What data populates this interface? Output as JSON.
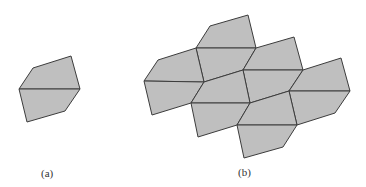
{
  "figure": {
    "panels": [
      {
        "id": "a",
        "label": "(a)",
        "label_pos": [
          41,
          167
        ]
      },
      {
        "id": "b",
        "label": "(b)",
        "label_pos": [
          238,
          166
        ]
      }
    ],
    "colors": {
      "fill": "#bfbfbf",
      "stroke": "#3c3c3c"
    }
  }
}
